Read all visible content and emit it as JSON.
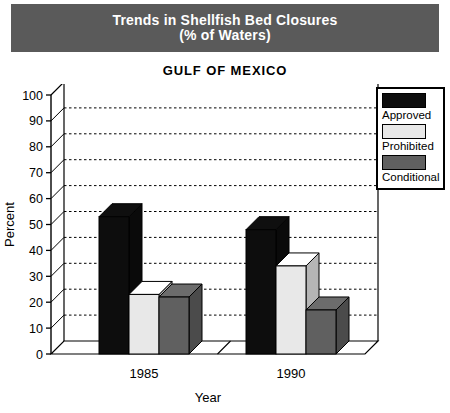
{
  "banner": {
    "line1": "Trends in Shellfish Bed Closures",
    "line2": "(% of Waters)",
    "background_color": "#5a5a5a",
    "text_color": "#ffffff"
  },
  "legend": {
    "items": [
      {
        "label": "Approved",
        "color": "#0d0d0d"
      },
      {
        "label": "Prohibited",
        "color": "#e8e8e8"
      },
      {
        "label": "Conditional",
        "color": "#606060"
      }
    ]
  },
  "chart_data": {
    "type": "bar",
    "title": "GULF OF MEXICO",
    "xlabel": "Year",
    "ylabel": "Percent",
    "categories": [
      "1985",
      "1990"
    ],
    "series": [
      {
        "name": "Approved",
        "color": "#0d0d0d",
        "values": [
          53,
          48
        ]
      },
      {
        "name": "Prohibited",
        "color": "#e8e8e8",
        "values": [
          23,
          34
        ]
      },
      {
        "name": "Conditional",
        "color": "#606060",
        "values": [
          22,
          17
        ]
      }
    ],
    "ylim": [
      0,
      100
    ],
    "yticks": [
      0,
      10,
      20,
      30,
      40,
      50,
      60,
      70,
      80,
      90,
      100
    ],
    "ytick_labels": [
      "0",
      "10",
      "20",
      "30",
      "40",
      "50",
      "60",
      "70",
      "80",
      "90",
      "100"
    ],
    "grid": true,
    "grid_style": "dotted-horizontal",
    "legend_position": "outside-top-right",
    "style": "3d-bars"
  }
}
